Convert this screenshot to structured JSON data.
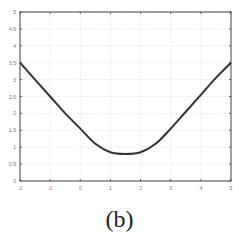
{
  "caption": "(b)",
  "chart_data": {
    "type": "line",
    "title": "",
    "xlabel": "",
    "ylabel": "",
    "xlim": [
      -2,
      5
    ],
    "ylim": [
      0,
      5
    ],
    "grid": true,
    "x_ticks": [
      -2,
      -1,
      0,
      1,
      2,
      3,
      4,
      5
    ],
    "y_ticks": [
      0,
      0.5,
      1,
      1.5,
      2,
      2.5,
      3,
      3.5,
      4,
      4.5,
      5
    ],
    "series": [
      {
        "name": "curve",
        "color": "#333333",
        "x": [
          -2,
          -1.5,
          -1,
          -0.5,
          0,
          0.5,
          1,
          1.5,
          2,
          2.5,
          3,
          3.5,
          4,
          4.5,
          5
        ],
        "y": [
          3.5,
          3.0,
          2.5,
          2.0,
          1.55,
          1.1,
          0.85,
          0.8,
          0.85,
          1.1,
          1.55,
          2.05,
          2.55,
          3.05,
          3.5
        ]
      }
    ]
  }
}
